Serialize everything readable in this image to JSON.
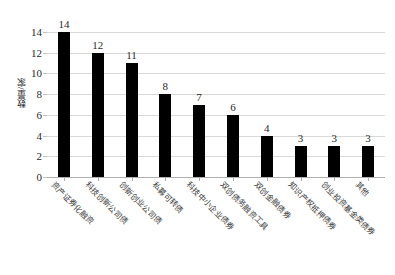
{
  "chart_data": {
    "type": "bar",
    "title": "",
    "xlabel": "",
    "ylabel": "数量/家",
    "ylim": [
      0,
      14
    ],
    "yticks": [
      0,
      2,
      4,
      6,
      8,
      10,
      12,
      14
    ],
    "grid": true,
    "legend": "none",
    "bar_color": "#000000",
    "gridline_color": "#d9d9d9",
    "categories": [
      "资产证券化融资",
      "科技创新公司债",
      "创新创业公司债",
      "私募可转债",
      "科技中小企业债券",
      "双创债务融资工具",
      "双创金融债券",
      "知识产权抵押债券",
      "创业投资基金类债券",
      "其他"
    ],
    "values": [
      14,
      12,
      11,
      8,
      7,
      6,
      4,
      3,
      3,
      3
    ],
    "value_labels": [
      "14",
      "12",
      "11",
      "8",
      "7",
      "6",
      "4",
      "3",
      "3",
      "3"
    ]
  }
}
